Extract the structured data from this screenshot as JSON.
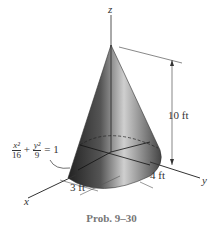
{
  "figure": {
    "axes": {
      "x": "x",
      "y": "y",
      "z": "z"
    },
    "height_label": "10 ft",
    "semi_axis_y_label": "4 ft",
    "semi_axis_x_label": "3 ft",
    "equation": {
      "x_num": "x²",
      "x_den": "16",
      "y_num": "y²",
      "y_den": "9",
      "plus": "+",
      "rhs": "= 1"
    },
    "caption": "Prob. 9–30"
  }
}
